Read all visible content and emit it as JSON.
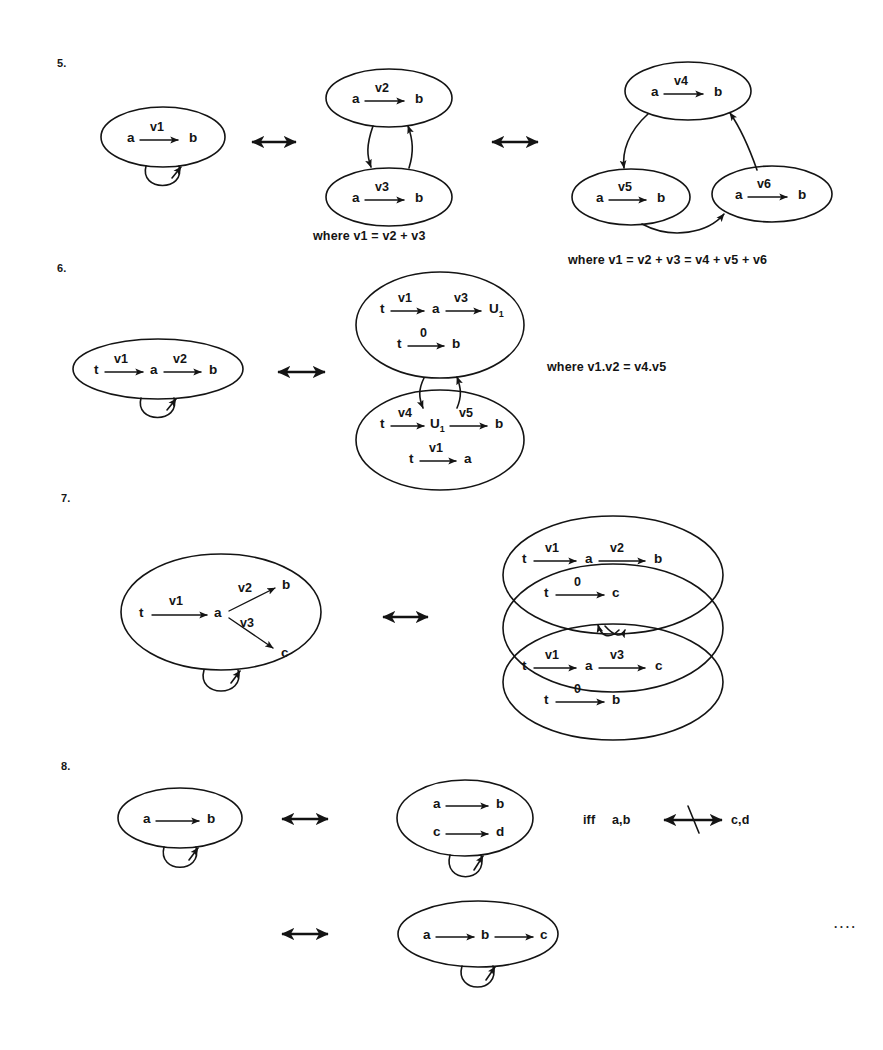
{
  "document": {
    "kind": "hand-drawn mathematical diagram figure",
    "background_color": "#ffffff",
    "ink_color": "#141414",
    "trailing_dots": "...."
  },
  "items": [
    {
      "number": "5.",
      "caption_left": "where v1 = v2 + v3",
      "caption_right": "where v1 = v2 + v3 = v4 + v5 + v6",
      "diagrams": [
        {
          "id": "d5a",
          "bubbles": [
            {
              "id": "b1",
              "edges": [
                {
                  "from": "a",
                  "label": "v1",
                  "to": "b"
                }
              ]
            }
          ],
          "self_loop": true
        },
        {
          "id": "d5b",
          "bubbles": [
            {
              "id": "b2",
              "edges": [
                {
                  "from": "a",
                  "label": "v2",
                  "to": "b"
                }
              ]
            },
            {
              "id": "b3",
              "edges": [
                {
                  "from": "a",
                  "label": "v3",
                  "to": "b"
                }
              ]
            }
          ]
        },
        {
          "id": "d5c",
          "bubbles": [
            {
              "id": "b4",
              "edges": [
                {
                  "from": "a",
                  "label": "v4",
                  "to": "b"
                }
              ]
            },
            {
              "id": "b5",
              "edges": [
                {
                  "from": "a",
                  "label": "v5",
                  "to": "b"
                }
              ]
            },
            {
              "id": "b6",
              "edges": [
                {
                  "from": "a",
                  "label": "v6",
                  "to": "b"
                }
              ]
            }
          ]
        }
      ]
    },
    {
      "number": "6.",
      "caption_right": "where  v1.v2 = v4.v5",
      "diagrams": [
        {
          "id": "d6a",
          "bubbles": [
            {
              "id": "b1",
              "edges": [
                {
                  "from": "t",
                  "label": "v1",
                  "to": "a"
                },
                {
                  "from": "a",
                  "label": "v2",
                  "to": "b"
                }
              ]
            }
          ],
          "self_loop": true
        },
        {
          "id": "d6b",
          "bubbles": [
            {
              "id": "b2",
              "rows": [
                "t -v1-> a -v3-> U₁",
                "t -0-> b"
              ]
            },
            {
              "id": "b3",
              "rows": [
                "t -v4-> U₁ -v5-> b",
                "t -v1-> a"
              ]
            }
          ]
        }
      ]
    },
    {
      "number": "7.",
      "diagrams": [
        {
          "id": "d7a",
          "bubbles": [
            {
              "id": "b1",
              "rows": [
                "t -v1-> a",
                "a -v2-> b",
                "a -v3-> c"
              ]
            }
          ],
          "self_loop": true
        },
        {
          "id": "d7b",
          "bubbles": [
            {
              "id": "b2",
              "rows": [
                "t -v1-> a -v2-> b",
                "t -0-> c"
              ]
            },
            {
              "id": "b3",
              "rows": [
                "t -v1-> a -v3-> c",
                "t -0-> b"
              ]
            }
          ]
        }
      ]
    },
    {
      "number": "8.",
      "condition": {
        "prefix": "iff",
        "left": "a,b",
        "relation": "not-equivalent",
        "right": "c,d"
      },
      "diagrams": [
        {
          "id": "d8a",
          "bubbles": [
            {
              "id": "b1",
              "rows": [
                "a --> b"
              ]
            }
          ],
          "self_loop": true
        },
        {
          "id": "d8b",
          "bubbles": [
            {
              "id": "b2",
              "rows": [
                "a --> b",
                "c --> d"
              ]
            }
          ],
          "self_loop": true
        },
        {
          "id": "d8c",
          "bubbles": [
            {
              "id": "b3",
              "rows": [
                "a --> b --> c"
              ]
            }
          ],
          "self_loop": true
        }
      ]
    }
  ],
  "labels": {
    "n_a": "a",
    "n_b": "b",
    "n_c": "c",
    "n_d": "d",
    "n_t": "t",
    "n_U": "U",
    "n_U_sub": "1",
    "e_v1": "v1",
    "e_v2": "v2",
    "e_v3": "v3",
    "e_v4": "v4",
    "e_v5": "v5",
    "e_v6": "v6",
    "e_zero": "0",
    "w5a": "where v1 = v2 + v3",
    "w5b": "where v1 = v2 + v3 = v4 + v5 + v6",
    "w6": "where  v1.v2 = v4.v5",
    "iff": "iff",
    "ab": "a,b",
    "cd": "c,d",
    "num5": "5.",
    "num6": "6.",
    "num7": "7.",
    "num8": "8.",
    "dots": "...."
  }
}
